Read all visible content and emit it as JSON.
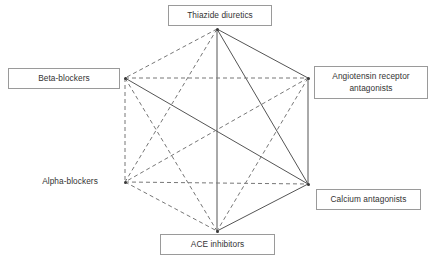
{
  "figure": {
    "background_color": "#ffffff",
    "width": 432,
    "height": 261
  },
  "chart_data": {
    "type": "diagram",
    "subtype": "network-graph",
    "title": "",
    "layout": "hexagon",
    "nodes": [
      {
        "id": "thiazide",
        "label": "Thiazide diuretics",
        "x": 217,
        "y": 29,
        "boxed": true,
        "box": {
          "x": 168,
          "y": 5,
          "width": 104,
          "height": 21
        },
        "lines": 1
      },
      {
        "id": "beta",
        "label": "Beta-blockers",
        "x": 125,
        "y": 78,
        "boxed": true,
        "box": {
          "x": 8,
          "y": 68,
          "width": 112,
          "height": 21
        },
        "lines": 1
      },
      {
        "id": "arb",
        "label": "Angiotensin receptor\nantagonists",
        "x": 308,
        "y": 78,
        "boxed": true,
        "box": {
          "x": 314,
          "y": 66,
          "width": 114,
          "height": 33
        },
        "lines": 2
      },
      {
        "id": "alpha",
        "label": "Alpha-blockers",
        "x": 125,
        "y": 182,
        "boxed": false,
        "box": {
          "x": 30,
          "y": 174,
          "width": 80,
          "height": 16
        },
        "lines": 1
      },
      {
        "id": "calcium",
        "label": "Calcium antagonists",
        "x": 308,
        "y": 184,
        "boxed": true,
        "box": {
          "x": 316,
          "y": 189,
          "width": 105,
          "height": 21
        },
        "lines": 1
      },
      {
        "id": "ace",
        "label": "ACE inhibitors",
        "x": 217,
        "y": 231,
        "boxed": true,
        "box": {
          "x": 160,
          "y": 234,
          "width": 115,
          "height": 21
        },
        "lines": 1
      }
    ],
    "edges": [
      {
        "from": "thiazide",
        "to": "arb",
        "style": "solid"
      },
      {
        "from": "thiazide",
        "to": "ace",
        "style": "solid"
      },
      {
        "from": "thiazide",
        "to": "calcium",
        "style": "solid"
      },
      {
        "from": "arb",
        "to": "calcium",
        "style": "solid"
      },
      {
        "from": "ace",
        "to": "calcium",
        "style": "solid"
      },
      {
        "from": "beta",
        "to": "calcium",
        "style": "solid"
      },
      {
        "from": "thiazide",
        "to": "beta",
        "style": "dashed"
      },
      {
        "from": "thiazide",
        "to": "alpha",
        "style": "dashed"
      },
      {
        "from": "beta",
        "to": "arb",
        "style": "dashed"
      },
      {
        "from": "beta",
        "to": "alpha",
        "style": "dashed"
      },
      {
        "from": "beta",
        "to": "ace",
        "style": "dashed"
      },
      {
        "from": "arb",
        "to": "alpha",
        "style": "dashed"
      },
      {
        "from": "arb",
        "to": "ace",
        "style": "dashed"
      },
      {
        "from": "alpha",
        "to": "calcium",
        "style": "dashed"
      },
      {
        "from": "alpha",
        "to": "ace",
        "style": "dashed"
      }
    ],
    "edge_styles": {
      "solid": {
        "color": "#555555",
        "width": 1,
        "dash": "none"
      },
      "dashed": {
        "color": "#777777",
        "width": 1,
        "dash": "4,3"
      }
    },
    "legend": [],
    "annotations": []
  }
}
